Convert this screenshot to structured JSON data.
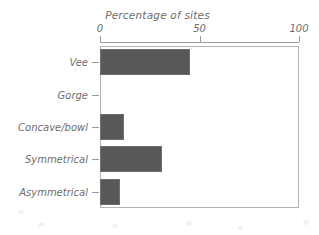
{
  "chart_data": {
    "type": "bar",
    "orientation": "horizontal",
    "title": "Percentage of sites",
    "xlabel": "",
    "ylabel": "",
    "xlim": [
      0,
      100
    ],
    "xticks": [
      0,
      50,
      100
    ],
    "xtick_labels": [
      "0",
      "50",
      "100"
    ],
    "grid": false,
    "legend": false,
    "axis_position": "top",
    "categories": [
      "Vee",
      "Gorge",
      "Concave/bowl",
      "Symmetrical",
      "Asymmetrical"
    ],
    "values": [
      45,
      0,
      12,
      31,
      10
    ],
    "bars": [
      {
        "label": "Vee",
        "value": 45
      },
      {
        "label": "Gorge",
        "value": 0
      },
      {
        "label": "Concave/bowl",
        "value": 12
      },
      {
        "label": "Symmetrical",
        "value": 31
      },
      {
        "label": "Asymmetrical",
        "value": 10
      }
    ],
    "colors": {
      "bar_fill": "#585858",
      "bar_edge": "#6f6f6f",
      "axis": "#9a9a9a",
      "frame": "#b4b4b4",
      "text": "#6d6d6d",
      "background": "#ffffff"
    }
  }
}
